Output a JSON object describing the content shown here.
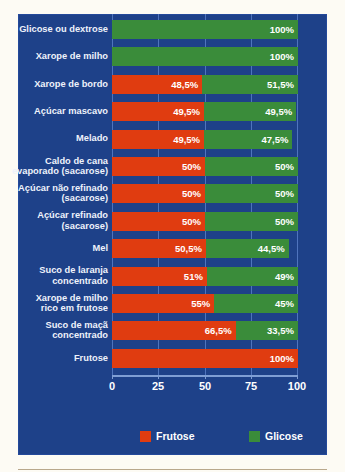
{
  "chart_data": {
    "type": "bar",
    "orientation": "horizontal",
    "stacked": true,
    "title": "",
    "xlabel": "",
    "ylabel": "",
    "xlim": [
      0,
      100
    ],
    "xticks": [
      "0",
      "25",
      "50",
      "75",
      "100"
    ],
    "grid": true,
    "legend_position": "bottom",
    "categories": [
      "Glicose ou dextrose",
      "Xarope de milho",
      "Xarope de bordo",
      "Açúcar mascavo",
      "Melado",
      "Caldo de cana evaporado (sacarose)",
      "Açúcar não refinado (sacarose)",
      "Açúcar refinado (sacarose)",
      "Mel",
      "Suco de laranja concentrado",
      "Xarope de milho rico em frutose",
      "Suco de maçã concentrado",
      "Frutose"
    ],
    "series": [
      {
        "name": "Frutose",
        "color": "#e03c10",
        "values": [
          0,
          0,
          48.5,
          49.5,
          49.5,
          50,
          50,
          50,
          50.5,
          51,
          55,
          66.5,
          100
        ],
        "labels": [
          "",
          "",
          "48,5%",
          "49,5%",
          "49,5%",
          "50%",
          "50%",
          "50%",
          "50,5%",
          "51%",
          "55%",
          "66,5%",
          "100%"
        ]
      },
      {
        "name": "Glicose",
        "color": "#3a8c3a",
        "values": [
          100,
          100,
          51.5,
          49.5,
          47.5,
          50,
          50,
          50,
          44.5,
          49,
          45,
          33.5,
          0
        ],
        "labels": [
          "100%",
          "100%",
          "51,5%",
          "49,5%",
          "47,5%",
          "50%",
          "50%",
          "50%",
          "44,5%",
          "49%",
          "45%",
          "33,5%",
          ""
        ]
      }
    ],
    "category_label_lines": [
      [
        "Glicose ou dextrose"
      ],
      [
        "Xarope de milho"
      ],
      [
        "Xarope de bordo"
      ],
      [
        "Açúcar mascavo"
      ],
      [
        "Melado"
      ],
      [
        "Caldo de cana",
        "evaporado (sacarose)"
      ],
      [
        "Açúcar não refinado",
        "(sacarose)"
      ],
      [
        "Açúcar refinado",
        "(sacarose)"
      ],
      [
        "Mel"
      ],
      [
        "Suco de laranja",
        "concentrado"
      ],
      [
        "Xarope de milho",
        "rico em frutose"
      ],
      [
        "Suco de maçã",
        "concentrado"
      ],
      [
        "Frutose"
      ]
    ]
  },
  "legend": {
    "items": [
      {
        "label": "Frutose",
        "color": "#e03c10"
      },
      {
        "label": "Glicose",
        "color": "#3a8c3a"
      }
    ]
  },
  "colors": {
    "panel_background": "#1e4189",
    "page_background": "#fdfbf4",
    "gridline": "#4f74bd",
    "axis": "#7f9ed4",
    "text": "#eef2fb",
    "frutose": "#e03c10",
    "glicose": "#3a8c3a",
    "bottom_rule": "#b9a88c"
  }
}
